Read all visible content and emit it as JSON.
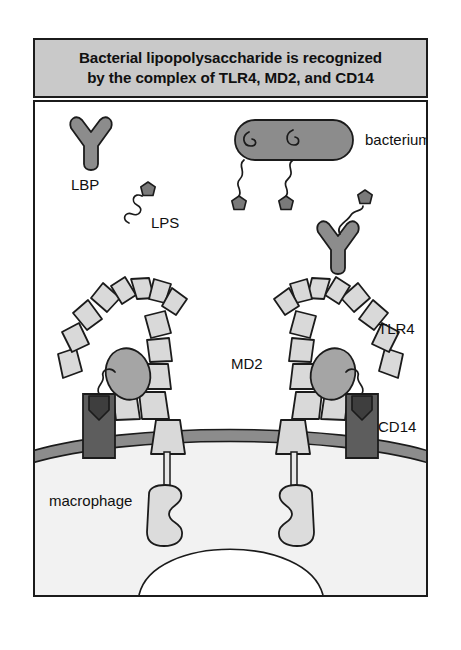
{
  "figure": {
    "title_line1": "Bacterial lipopolysaccharide is recognized",
    "title_line2": "by the complex of TLR4, MD2, and CD14",
    "labels": {
      "lbp": "LBP",
      "lps": "LPS",
      "bacterium": "bacterium",
      "tlr4": "TLR4",
      "md2": "MD2",
      "cd14": "CD14",
      "macrophage": "macrophage"
    },
    "colors": {
      "title_background": "#c9c9c9",
      "frame_border": "#1b1b1b",
      "canvas_background": "#ffffff",
      "tlr4_segment": "#d9d9d9",
      "md2_oval": "#a5a5a5",
      "cd14_body": "#5d5d5d",
      "bacterium_body": "#8c8c8c",
      "lbp_body": "#8c8c8c",
      "lps_head": "#7a7a7a",
      "membrane_band": "#8c8c8c",
      "cytoplasm": "#f2f2f2",
      "tir_domain": "#dcdcdc",
      "outline": "#1b1b1b"
    }
  }
}
